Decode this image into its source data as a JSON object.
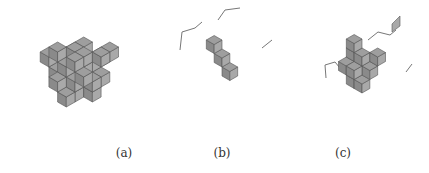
{
  "figure": {
    "panels": [
      {
        "id": "a",
        "caption": "(a)",
        "caption_x": 41,
        "left": 0,
        "width": 150,
        "height": 130,
        "origin": [
          75,
          72
        ],
        "size": 10,
        "cubes": [
          [
            0,
            0,
            0
          ],
          [
            1,
            0,
            0
          ],
          [
            2,
            0,
            0
          ],
          [
            -1,
            0,
            0
          ],
          [
            0,
            1,
            0
          ],
          [
            1,
            1,
            0
          ],
          [
            -1,
            1,
            0
          ],
          [
            0,
            -1,
            0
          ],
          [
            1,
            -1,
            0
          ],
          [
            2,
            -1,
            0
          ],
          [
            0,
            0,
            1
          ],
          [
            1,
            0,
            1
          ],
          [
            -1,
            0,
            1
          ],
          [
            0,
            1,
            1
          ],
          [
            2,
            1,
            1
          ],
          [
            0,
            -1,
            1
          ],
          [
            1,
            -1,
            1
          ],
          [
            -1,
            -1,
            1
          ],
          [
            0,
            0,
            2
          ],
          [
            1,
            0,
            2
          ],
          [
            -1,
            1,
            2
          ],
          [
            0,
            -1,
            2
          ],
          [
            2,
            -1,
            2
          ],
          [
            1,
            1,
            2
          ],
          [
            -1,
            0,
            -1
          ],
          [
            0,
            1,
            -1
          ],
          [
            1,
            0,
            -1
          ],
          [
            1,
            1,
            -1
          ],
          [
            0,
            -1,
            -1
          ],
          [
            2,
            0,
            -1
          ],
          [
            1,
            -2,
            1
          ],
          [
            2,
            -2,
            2
          ],
          [
            -2,
            0,
            0
          ],
          [
            -2,
            1,
            1
          ],
          [
            0,
            2,
            0
          ],
          [
            1,
            2,
            -1
          ]
        ],
        "lines": []
      },
      {
        "id": "b",
        "caption": "(b)",
        "caption_x": 184,
        "left": 170,
        "width": 110,
        "height": 130,
        "origin": [
          52,
          58
        ],
        "size": 9,
        "cubes": [
          [
            -1,
            0,
            1
          ],
          [
            0,
            0,
            0
          ],
          [
            1,
            0,
            -1
          ]
        ],
        "lines": [
          [
            [
              10,
              50
            ],
            [
              12,
              32
            ],
            [
              25,
              28
            ],
            [
              32,
              22
            ]
          ],
          [
            [
              48,
              20
            ],
            [
              55,
              10
            ],
            [
              70,
              8
            ]
          ],
          [
            [
              92,
              48
            ],
            [
              102,
              40
            ]
          ]
        ]
      },
      {
        "id": "c",
        "caption": "(c)",
        "caption_x": 325,
        "left": 300,
        "width": 129,
        "height": 130,
        "origin": [
          62,
          66
        ],
        "size": 9,
        "cubes": [
          [
            -1,
            0,
            2
          ],
          [
            -1,
            0,
            1
          ],
          [
            -1,
            0,
            0
          ],
          [
            0,
            0,
            1
          ],
          [
            0,
            0,
            0
          ],
          [
            1,
            0,
            0
          ],
          [
            0,
            1,
            0
          ],
          [
            1,
            1,
            -1
          ],
          [
            -1,
            1,
            0
          ],
          [
            0,
            -1,
            0
          ],
          [
            1,
            -1,
            1
          ],
          [
            0,
            1,
            -1
          ]
        ],
        "float_cube": [
          96,
          22
        ],
        "lines": [
          [
            [
              26,
              78
            ],
            [
              25,
              65
            ],
            [
              35,
              62
            ],
            [
              40,
              68
            ]
          ],
          [
            [
              68,
              40
            ],
            [
              78,
              32
            ],
            [
              90,
              35
            ],
            [
              96,
              30
            ]
          ],
          [
            [
              106,
              72
            ],
            [
              112,
              64
            ]
          ]
        ]
      }
    ]
  },
  "style": {
    "top_color": "#9e9e9e",
    "left_color": "#8a8a8a",
    "right_color": "#a9a9a9",
    "edge_color": "#555555",
    "line_color": "#777777"
  }
}
